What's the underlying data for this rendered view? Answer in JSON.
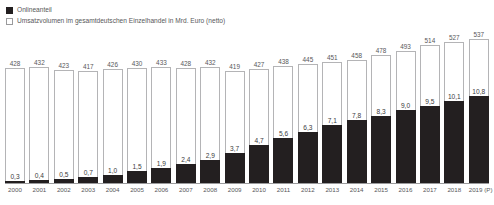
{
  "legend": {
    "items": [
      {
        "label": "Onlineanteil",
        "swatch": "dark",
        "color": "#231f20"
      },
      {
        "label": "Umsatzvolumen im gesamtdeutschen Einzelhandel in Mrd. Euro (netto)",
        "swatch": "light",
        "color": "#ffffff"
      }
    ]
  },
  "chart_data": {
    "type": "bar",
    "title": "",
    "subtitle": "",
    "xlabel": "",
    "ylabel": "",
    "grid": false,
    "legend_position": "top-left",
    "stacked": true,
    "ylim": [
      0,
      560
    ],
    "categories": [
      "2000",
      "2001",
      "2002",
      "2003",
      "2004",
      "2005",
      "2006",
      "2007",
      "2008",
      "2009",
      "2010",
      "2011",
      "2012",
      "2013",
      "2014",
      "2015",
      "2016",
      "2017",
      "2018",
      "2019 (P)"
    ],
    "series": [
      {
        "name": "Umsatzvolumen im gesamtdeutschen Einzelhandel in Mrd. Euro (netto)",
        "color": "#ffffff",
        "values": [
          428,
          432,
          423,
          417,
          426,
          430,
          433,
          428,
          432,
          419,
          427,
          438,
          445,
          451,
          458,
          478,
          493,
          514,
          527,
          537
        ],
        "labels": [
          "428",
          "432",
          "423",
          "417",
          "426",
          "430",
          "433",
          "428",
          "432",
          "419",
          "427",
          "438",
          "445",
          "451",
          "458",
          "478",
          "493",
          "514",
          "527",
          "537"
        ]
      },
      {
        "name": "Onlineanteil",
        "color": "#231f20",
        "values": [
          0.3,
          0.4,
          0.5,
          0.7,
          1.0,
          1.5,
          1.9,
          2.4,
          2.9,
          3.7,
          4.7,
          5.6,
          6.3,
          7.1,
          7.8,
          8.3,
          9.0,
          9.5,
          10.1,
          10.8
        ],
        "labels": [
          "0,3",
          "0,4",
          "0,5",
          "0,7",
          "1,0",
          "1,5",
          "1,9",
          "2,4",
          "2,9",
          "3,7",
          "4,7",
          "5,6",
          "6,3",
          "7,1",
          "7,8",
          "8,3",
          "9,0",
          "9,5",
          "10,1",
          "10,8"
        ]
      }
    ]
  }
}
